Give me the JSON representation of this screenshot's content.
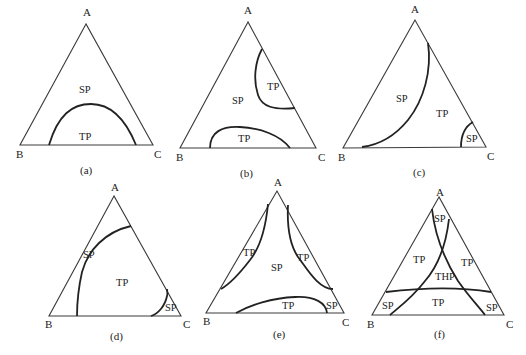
{
  "figure": {
    "panels": [
      {
        "id": "a",
        "caption": "(a)",
        "vertices": {
          "top": "A",
          "left": "B",
          "right": "C"
        },
        "regions": [
          "SP",
          "TP"
        ]
      },
      {
        "id": "b",
        "caption": "(b)",
        "vertices": {
          "top": "A",
          "left": "B",
          "right": "C"
        },
        "regions": [
          "SP",
          "TP",
          "TP"
        ]
      },
      {
        "id": "c",
        "caption": "(c)",
        "vertices": {
          "top": "A",
          "left": "B",
          "right": "C"
        },
        "regions": [
          "SP",
          "TP",
          "SP"
        ]
      },
      {
        "id": "d",
        "caption": "(d)",
        "vertices": {
          "top": "A",
          "left": "B",
          "right": "C"
        },
        "regions": [
          "SP",
          "TP",
          "SP"
        ]
      },
      {
        "id": "e",
        "caption": "(e)",
        "vertices": {
          "top": "A",
          "left": "B",
          "right": "C"
        },
        "regions": [
          "TP",
          "SP",
          "TP",
          "TP",
          "SP"
        ]
      },
      {
        "id": "f",
        "caption": "(f)",
        "vertices": {
          "top": "A",
          "left": "B",
          "right": "C"
        },
        "regions": [
          "SP",
          "TP",
          "THP",
          "TP",
          "SP",
          "TP",
          "SP"
        ]
      }
    ]
  }
}
